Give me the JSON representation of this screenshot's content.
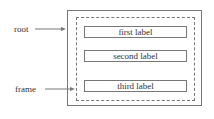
{
  "diagram": {
    "callouts": [
      {
        "label": "root",
        "target": "outer frame border"
      },
      {
        "label": "frame",
        "target": "dashed inner frame"
      }
    ],
    "labels": [
      "first label",
      "second label",
      "third label"
    ]
  }
}
